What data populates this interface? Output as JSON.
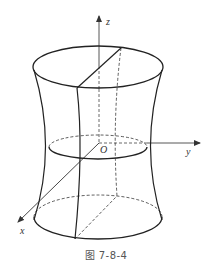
{
  "figure": {
    "caption": "图 7-8-4"
  },
  "axes": {
    "x_label": "x",
    "y_label": "y",
    "z_label": "z",
    "origin_label": "O"
  },
  "colors": {
    "stroke": "#222222",
    "axis": "#444444",
    "background": "#ffffff"
  }
}
